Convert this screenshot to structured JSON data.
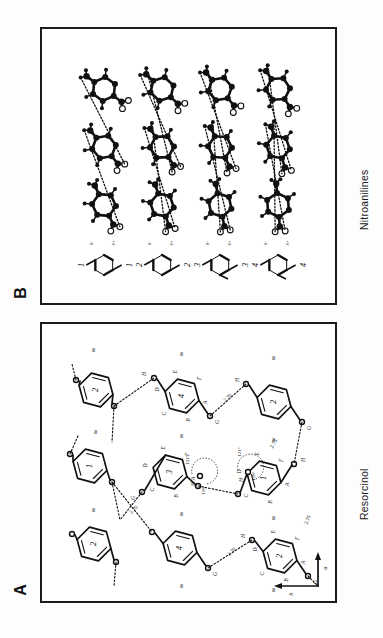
{
  "figure": {
    "panels": [
      {
        "id": "B",
        "letter": "B",
        "caption": "Nitroanilines",
        "rows": [
          {
            "number": "1",
            "schematic_labels": [
              "δ+",
              "δ-"
            ]
          },
          {
            "number": "2",
            "schematic_labels": [
              "δ+",
              "δ-"
            ]
          },
          {
            "number": "3",
            "schematic_labels": [
              "δ+",
              "δ-"
            ]
          },
          {
            "number": "4",
            "schematic_labels": [
              "δ+",
              "δ-"
            ]
          }
        ]
      },
      {
        "id": "A",
        "letter": "A",
        "caption": "Resorcinol",
        "ring_numbers": [
          "1",
          "2",
          "3",
          "4"
        ],
        "atom_labels": [
          "A",
          "B",
          "C",
          "D",
          "E",
          "F",
          "G",
          "H"
        ],
        "distances": [
          "2.70",
          "2.75",
          "2.70",
          "2.75",
          "2.70"
        ],
        "angles": [
          "121°",
          "118°",
          "121°",
          "118°"
        ],
        "axes": [
          "a",
          "b"
        ],
        "squiggle": "≈"
      }
    ]
  },
  "panel_b": {
    "letter": "B",
    "caption": "Nitroanilines"
  },
  "panel_a": {
    "letter": "A",
    "caption": "Resorcinol",
    "axis_a": "a",
    "axis_b": "b",
    "rings": {
      "r1": "1",
      "r2": "2",
      "r3": "3",
      "r4": "4"
    },
    "dist": {
      "d1": "2.70",
      "d2": "2.75",
      "d3": "2.70",
      "d4": "2.75",
      "d5": "2.70"
    },
    "ang": {
      "a1": "121°",
      "a2": "118°",
      "a3": "121°",
      "a4": "118°"
    },
    "atoms": {
      "A": "A",
      "B": "B",
      "C": "C",
      "D": "D",
      "E": "E",
      "F": "F",
      "G": "G",
      "H": "H"
    }
  },
  "colors": {
    "ink": "#111111",
    "background": "#ffffff",
    "border": "#1b1b1b"
  }
}
